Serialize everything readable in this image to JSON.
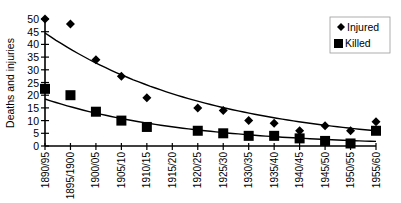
{
  "chart_data": {
    "type": "scatter",
    "title": "",
    "xlabel": "",
    "ylabel": "Deaths and injuries",
    "ylim": [
      0,
      50
    ],
    "yticks": [
      0,
      5,
      10,
      15,
      20,
      25,
      30,
      35,
      40,
      45,
      50
    ],
    "grid": false,
    "legend_position": "top-right",
    "categories": [
      "1890/95",
      "1895/1900",
      "1900/05",
      "1905/10",
      "1910/15",
      "1915/20",
      "1920/25",
      "1925/30",
      "1930/35",
      "1935/40",
      "1940/45",
      "1945/50",
      "1950/55",
      "1955/60"
    ],
    "series": [
      {
        "name": "Injured",
        "marker": "diamond",
        "values": [
          50,
          48,
          34,
          27.5,
          19,
          null,
          15,
          14,
          10,
          9,
          6,
          8,
          6,
          9.5
        ],
        "trendline": "exponential",
        "trend_start": 44.5,
        "trend_end": 6
      },
      {
        "name": "Killed",
        "marker": "square",
        "values": [
          22.5,
          20,
          13.5,
          10,
          7.5,
          null,
          6,
          5,
          4,
          4,
          3,
          2,
          1,
          6
        ],
        "trendline": "exponential",
        "trend_start": 18.5,
        "trend_end": 1.8
      }
    ]
  },
  "legend": {
    "items": [
      {
        "label": "Injured",
        "marker": "diamond"
      },
      {
        "label": "Killed",
        "marker": "square"
      }
    ]
  },
  "axis": {
    "ylabel": "Deaths and injuries"
  }
}
